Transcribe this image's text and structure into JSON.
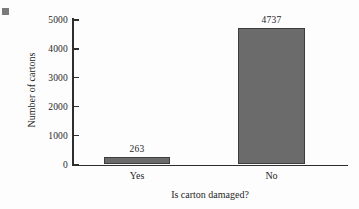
{
  "chart_data": {
    "type": "bar",
    "title": "",
    "xlabel": "Is carton damaged?",
    "ylabel": "Number of cartons",
    "categories": [
      "Yes",
      "No"
    ],
    "values": [
      263,
      4737
    ],
    "value_labels": [
      "263",
      "4737"
    ],
    "ylim": [
      0,
      5000
    ],
    "ytick_values": [
      5000,
      4000,
      3000,
      2000,
      1000,
      0
    ],
    "yticks": [
      "5000",
      "4000",
      "3000",
      "2000",
      "1000",
      "0"
    ],
    "grid": false,
    "legend": null,
    "bar_color": "#6b6b6b",
    "bar_edge_color": "#3d3d3d",
    "axis_color": "#2e2e2e",
    "background_color": "#fdfdfd"
  },
  "decorations": {
    "corner_marker_name": "gray-square-marker",
    "corner_marker_color": "#7a7a7a"
  }
}
